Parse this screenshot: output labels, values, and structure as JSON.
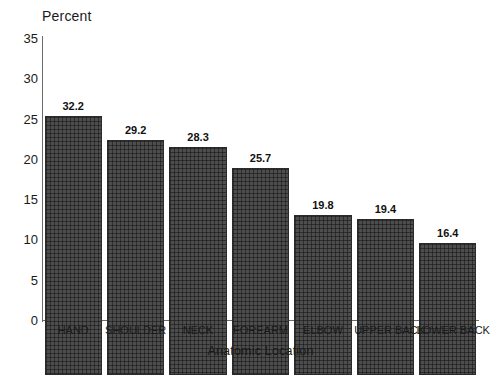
{
  "chart_data": {
    "type": "bar",
    "title": "",
    "xlabel": "Anatomic Location",
    "ylabel": "Percent",
    "categories": [
      "HAND",
      "SHOULDER",
      "NECK",
      "FOREARM",
      "ELBOW",
      "UPPER BACK",
      "LOWER BACK"
    ],
    "values": [
      32.2,
      29.2,
      28.3,
      25.7,
      19.8,
      19.4,
      16.4
    ],
    "value_labels": [
      "32.2",
      "29.2",
      "28.3",
      "25.7",
      "19.8",
      "19.4",
      "16.4"
    ],
    "ylim": [
      0,
      35
    ],
    "yticks": [
      0,
      5,
      10,
      15,
      20,
      25,
      30,
      35
    ],
    "ytick_labels": [
      "0",
      "5",
      "10",
      "15",
      "20",
      "25",
      "30",
      "35"
    ],
    "grid": false,
    "legend": "none",
    "bar_color": "#4d4d4d",
    "bar_edge_color": "#2b2b2b",
    "axis_color": "#6b6b6b",
    "background_color": "#ffffff",
    "text_color": "#1a1a1a"
  }
}
